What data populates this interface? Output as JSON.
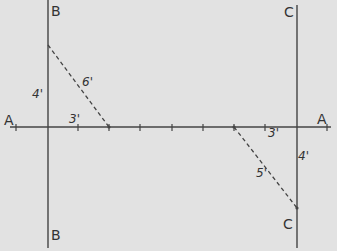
{
  "diagram": {
    "colors": {
      "background": "#e2e2e2",
      "line": "#444444",
      "dashed": "#444444",
      "text": "#333333"
    },
    "lines": {
      "baseline": {
        "label_left": "A",
        "label_right": "A"
      },
      "perpendicular_left": {
        "label_top": "B",
        "label_bottom": "B"
      },
      "perpendicular_right": {
        "label_top": "C",
        "label_bottom": "C"
      }
    },
    "left_triangle": {
      "vertical_leg": "4'",
      "hypotenuse": "6'",
      "base": "3'"
    },
    "right_triangle": {
      "base": "3'",
      "vertical_leg": "4'",
      "hypotenuse": "5'"
    }
  }
}
